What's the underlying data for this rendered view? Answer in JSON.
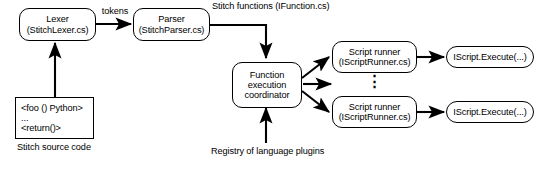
{
  "diagram": {
    "background": "#ffffff",
    "stroke": "#000000",
    "nodes": {
      "lexer": {
        "line1": "Lexer",
        "line2": "(StitchLexer.cs)"
      },
      "parser": {
        "line1": "Parser",
        "line2": "(StitchParser.cs)"
      },
      "coordinator": {
        "line1": "Function",
        "line2": "execution",
        "line3": "coordinator"
      },
      "script_runner_top": {
        "line1": "Script runner",
        "line2": "(IScriptRunner.cs)"
      },
      "script_runner_bottom": {
        "line1": "Script runner",
        "line2": "(IScriptRunner.cs)"
      },
      "iscript_execute_top": {
        "line1": "IScript.Execute(...)"
      },
      "iscript_execute_bottom": {
        "line1": "IScript.Execute(...)"
      },
      "source_code": {
        "line1": "<foo () Python>",
        "line2": "...",
        "line3": "<return()>"
      }
    },
    "labels": {
      "tokens": "tokens",
      "stitch_functions_line1": "Stitch functions",
      "stitch_functions_line2": "(IFunction.cs)",
      "registry_line1": "Registry of",
      "registry_line2": "language plugins",
      "source_caption_line1": "Stitch",
      "source_caption_line2": "source code",
      "ellipsis_vertical": "⋮"
    }
  }
}
